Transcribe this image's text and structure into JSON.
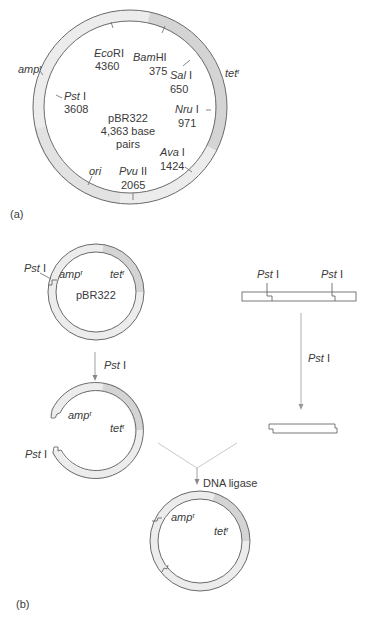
{
  "panel_a": {
    "label": "(a)",
    "plasmid": {
      "name": "pBR322",
      "size_line1": "4,363 base",
      "size_line2": "pairs"
    },
    "genes": {
      "amp": {
        "name": "amp",
        "sup": "r"
      },
      "tet": {
        "name": "tet",
        "sup": "r"
      },
      "ori": {
        "name": "ori"
      }
    },
    "sites": [
      {
        "enzyme": "Eco",
        "suffix": "RI",
        "position": "4360"
      },
      {
        "enzyme": "Bam",
        "suffix": "HI",
        "position": "375"
      },
      {
        "enzyme": "Sal",
        "suffix": " I",
        "position": "650"
      },
      {
        "enzyme": "Nru",
        "suffix": " I",
        "position": "971"
      },
      {
        "enzyme": "Ava",
        "suffix": " I",
        "position": "1424"
      },
      {
        "enzyme": "Pvu",
        "suffix": " II",
        "position": "2065"
      },
      {
        "enzyme": "Pst",
        "suffix": " I",
        "position": "3608"
      }
    ]
  },
  "panel_b": {
    "label": "(b)",
    "plasmid_name": "pBR322",
    "pst_label": "Pst",
    "pst_suffix": " I",
    "amp": {
      "name": "amp",
      "sup": "r"
    },
    "tet": {
      "name": "tet",
      "sup": "r"
    },
    "step1_enzyme": "Pst",
    "step1_suffix": " I",
    "step2_enzyme": "Pst",
    "step2_suffix": " I",
    "ligase_label": "DNA ligase",
    "fragment_sites": [
      {
        "enzyme": "Pst",
        "suffix": " I"
      },
      {
        "enzyme": "Pst",
        "suffix": " I"
      }
    ]
  },
  "colors": {
    "line": "#6a6a6a",
    "ring_light": "#ececec",
    "ring_dark": "#d4d4d4",
    "arrow": "#888888"
  }
}
